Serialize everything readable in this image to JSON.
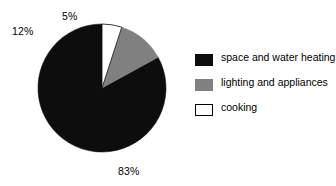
{
  "chart_data": {
    "type": "pie",
    "title": "",
    "categories": [
      "space and water heating",
      "lighting and appliances",
      "cooking"
    ],
    "values": [
      83,
      12,
      5
    ],
    "value_labels": [
      "83%",
      "12%",
      "5%"
    ],
    "colors": [
      "#0d0d0d",
      "#808080",
      "#ffffff"
    ],
    "legend_position": "right",
    "grid": false,
    "start_angle_deg": 90,
    "direction": "counterclockwise",
    "xlabel": "",
    "ylabel": ""
  },
  "labels": {
    "cooking_pct": "5%",
    "lighting_pct": "12%",
    "heating_pct": "83%"
  },
  "legend": {
    "items": [
      {
        "label": "space and water heating",
        "swatch": "black-swatch"
      },
      {
        "label": "lighting and appliances",
        "swatch": "gray-swatch"
      },
      {
        "label": "cooking",
        "swatch": "white-swatch"
      }
    ]
  }
}
